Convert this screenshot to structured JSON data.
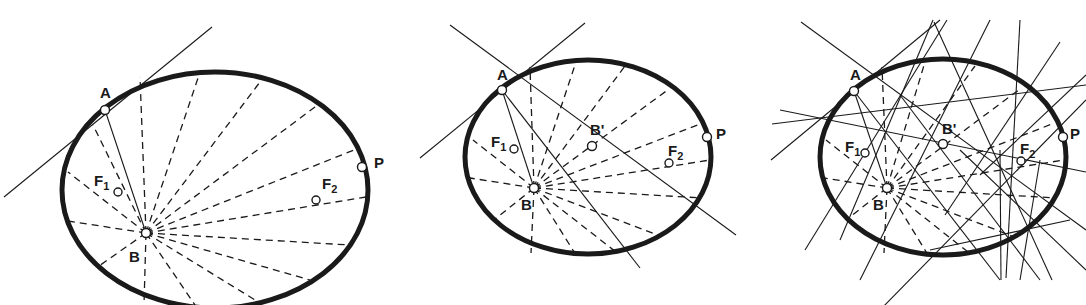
{
  "figure": {
    "ink": "#1a1a1a",
    "panels": [
      {
        "id": "panel-1",
        "ellipse": {
          "cx": 215,
          "cy": 190,
          "rx": 153,
          "ry": 118
        },
        "points": {
          "A": {
            "x": 105,
            "y": 110
          },
          "B": {
            "x": 146,
            "y": 233
          },
          "F1": {
            "x": 118,
            "y": 192
          },
          "F2": {
            "x": 316,
            "y": 200
          },
          "P": {
            "x": 362,
            "y": 167
          }
        },
        "labels": [
          {
            "key": "A",
            "text": "A",
            "sub": "",
            "x": 100,
            "y": 98
          },
          {
            "key": "B",
            "text": "B",
            "sub": "",
            "x": 129,
            "y": 262
          },
          {
            "key": "F1",
            "text": "F",
            "sub": "1",
            "x": 94,
            "y": 186
          },
          {
            "key": "F2",
            "text": "F",
            "sub": "2",
            "x": 322,
            "y": 189
          },
          {
            "key": "P",
            "text": "P",
            "sub": "",
            "x": 374,
            "y": 168
          }
        ],
        "solid_lines": [
          [
            4,
            197,
            212,
            27
          ],
          [
            105,
            110,
            146,
            233
          ]
        ],
        "dashed_fan_from": "B",
        "dashed_fan_endpoints": [
          [
            140,
            77
          ],
          [
            199,
            75
          ],
          [
            260,
            82
          ],
          [
            315,
            107
          ],
          [
            354,
            150
          ],
          [
            366,
            197
          ],
          [
            350,
            245
          ],
          [
            310,
            280
          ],
          [
            260,
            303
          ],
          [
            195,
            305
          ],
          [
            144,
            305
          ],
          [
            99,
            266
          ],
          [
            68,
            221
          ],
          [
            68,
            172
          ],
          [
            93,
            125
          ]
        ]
      },
      {
        "id": "panel-2",
        "ellipse": {
          "cx": 588,
          "cy": 157,
          "rx": 123,
          "ry": 97
        },
        "points": {
          "A": {
            "x": 502,
            "y": 90
          },
          "B": {
            "x": 534,
            "y": 188
          },
          "B'": {
            "x": 592,
            "y": 146
          },
          "F1": {
            "x": 514,
            "y": 149
          },
          "F2": {
            "x": 669,
            "y": 163
          },
          "P": {
            "x": 707,
            "y": 137
          }
        },
        "labels": [
          {
            "key": "A",
            "text": "A",
            "sub": "",
            "x": 497,
            "y": 80
          },
          {
            "key": "B",
            "text": "B",
            "sub": "",
            "x": 521,
            "y": 210
          },
          {
            "key": "B'",
            "text": "B'",
            "sub": "",
            "x": 590,
            "y": 135
          },
          {
            "key": "F1",
            "text": "F",
            "sub": "1",
            "x": 491,
            "y": 147
          },
          {
            "key": "F2",
            "text": "F",
            "sub": "2",
            "x": 668,
            "y": 156
          },
          {
            "key": "P",
            "text": "P",
            "sub": "",
            "x": 716,
            "y": 139
          }
        ],
        "solid_lines": [
          [
            420,
            158,
            585,
            23
          ],
          [
            450,
            25,
            736,
            235
          ],
          [
            502,
            90,
            534,
            188
          ],
          [
            502,
            90,
            640,
            268
          ]
        ],
        "dashed_fan_from": "B",
        "dashed_fan_endpoints": [
          [
            530,
            67
          ],
          [
            576,
            62
          ],
          [
            625,
            66
          ],
          [
            669,
            89
          ],
          [
            700,
            124
          ],
          [
            710,
            160
          ],
          [
            702,
            198
          ],
          [
            660,
            236
          ],
          [
            616,
            252
          ],
          [
            576,
            255
          ],
          [
            531,
            253
          ],
          [
            494,
            220
          ],
          [
            470,
            178
          ],
          [
            473,
            140
          ]
        ]
      },
      {
        "id": "panel-3",
        "ellipse": {
          "cx": 943,
          "cy": 157,
          "rx": 123,
          "ry": 98
        },
        "points": {
          "A": {
            "x": 854,
            "y": 91
          },
          "B": {
            "x": 887,
            "y": 188
          },
          "B'": {
            "x": 943,
            "y": 144
          },
          "F1": {
            "x": 865,
            "y": 153
          },
          "F2": {
            "x": 1021,
            "y": 161
          },
          "P": {
            "x": 1063,
            "y": 137
          }
        },
        "labels": [
          {
            "key": "A",
            "text": "A",
            "sub": "",
            "x": 850,
            "y": 80
          },
          {
            "key": "B",
            "text": "B",
            "sub": "",
            "x": 873,
            "y": 210
          },
          {
            "key": "B'",
            "text": "B'",
            "sub": "",
            "x": 942,
            "y": 134
          },
          {
            "key": "F1",
            "text": "F",
            "sub": "1",
            "x": 845,
            "y": 152
          },
          {
            "key": "F2",
            "text": "F",
            "sub": "2",
            "x": 1020,
            "y": 154
          },
          {
            "key": "P",
            "text": "P",
            "sub": "",
            "x": 1070,
            "y": 139
          }
        ],
        "solid_lines": [
          [
            801,
            22,
            1086,
            230
          ],
          [
            771,
            160,
            940,
            20
          ],
          [
            854,
            91,
            887,
            188
          ],
          [
            854,
            91,
            1000,
            280
          ],
          [
            772,
            124,
            1086,
            85
          ],
          [
            780,
            110,
            1086,
            172
          ],
          [
            934,
            22,
            1052,
            280
          ],
          [
            933,
            20,
            840,
            240
          ],
          [
            947,
            20,
            805,
            250
          ],
          [
            990,
            20,
            860,
            280
          ],
          [
            1020,
            20,
            1006,
            278
          ],
          [
            1060,
            42,
            945,
            215
          ],
          [
            1086,
            75,
            980,
            175
          ],
          [
            1086,
            100,
            880,
            310
          ],
          [
            1040,
            280,
            900,
            95
          ],
          [
            1086,
            270,
            960,
            150
          ],
          [
            1001,
            280,
            1000,
            150
          ],
          [
            1020,
            280,
            1040,
            160
          ],
          [
            1070,
            220,
            930,
            250
          ]
        ],
        "dashed_fan_from": "B",
        "dashed_fan_endpoints": [
          [
            882,
            67
          ],
          [
            925,
            62
          ],
          [
            975,
            66
          ],
          [
            1020,
            89
          ],
          [
            1052,
            124
          ],
          [
            1064,
            160
          ],
          [
            1056,
            198
          ],
          [
            1012,
            236
          ],
          [
            968,
            252
          ],
          [
            928,
            255
          ],
          [
            884,
            253
          ],
          [
            846,
            220
          ],
          [
            824,
            178
          ],
          [
            826,
            140
          ]
        ]
      }
    ]
  }
}
